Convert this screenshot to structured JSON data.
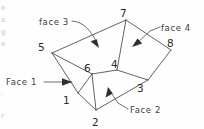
{
  "figure": {
    "background_color": "#fefefe",
    "line_color": "#3a3a3a"
  },
  "vertices": [
    {
      "id": "1",
      "label": "1",
      "point_x": 78,
      "point_y": 93,
      "label_x": 63,
      "label_y": 104
    },
    {
      "id": "2",
      "label": "2",
      "point_x": 96,
      "point_y": 110,
      "label_x": 92,
      "label_y": 126
    },
    {
      "id": "3",
      "label": "3",
      "point_x": 148,
      "point_y": 80,
      "label_x": 137,
      "label_y": 92
    },
    {
      "id": "4",
      "label": "4",
      "point_x": 117,
      "point_y": 70,
      "label_x": 111,
      "label_y": 68
    },
    {
      "id": "5",
      "label": "5",
      "point_x": 52,
      "point_y": 53,
      "label_x": 38,
      "label_y": 51
    },
    {
      "id": "6",
      "label": "6",
      "point_x": 92,
      "point_y": 74,
      "label_x": 84,
      "label_y": 72
    },
    {
      "id": "7",
      "label": "7",
      "point_x": 126,
      "point_y": 20,
      "label_x": 120,
      "label_y": 17
    },
    {
      "id": "8",
      "label": "8",
      "point_x": 171,
      "point_y": 50,
      "label_x": 167,
      "label_y": 47
    }
  ],
  "edges": [
    {
      "name": "edge-5-7",
      "from": "5",
      "to": "7"
    },
    {
      "name": "edge-7-8",
      "from": "7",
      "to": "8"
    },
    {
      "name": "edge-8-3",
      "from": "8",
      "to": "3"
    },
    {
      "name": "edge-3-2",
      "from": "3",
      "to": "2"
    },
    {
      "name": "edge-2-1",
      "from": "2",
      "to": "1"
    },
    {
      "name": "edge-1-5",
      "from": "1",
      "to": "5"
    },
    {
      "name": "edge-5-6",
      "from": "5",
      "to": "6"
    },
    {
      "name": "edge-6-4",
      "from": "6",
      "to": "4"
    },
    {
      "name": "edge-4-7",
      "from": "4",
      "to": "7"
    },
    {
      "name": "edge-4-3",
      "from": "4",
      "to": "3"
    },
    {
      "name": "edge-6-2",
      "from": "6",
      "to": "2"
    },
    {
      "name": "edge-1-6b",
      "from": "1",
      "to": "6"
    }
  ],
  "callouts": [
    {
      "name": "face-1",
      "label": "Face 1",
      "label_x": 6,
      "label_y": 85,
      "leader": "M 44 82 L 72 82",
      "arrow_points": "72,82 62,78.2 62,85.8",
      "target_vertex_hint": "left-side face between 5, 1, 6"
    },
    {
      "name": "face-2",
      "label": "Face 2",
      "label_x": 130,
      "label_y": 113,
      "leader": "M 128 109 L 118 103 L 112 94",
      "arrow_points": "108,87 105.6,97.6 112.8,93.4",
      "target_vertex_hint": "front face between 2, 3, 4, 6"
    },
    {
      "name": "face-3",
      "label": "face 3",
      "label_x": 39,
      "label_y": 25,
      "leader": "M 72 21 C 84 22 90 30 96 41",
      "arrow_points": "99,48 90.5,41.2 96.8,39.2",
      "target_vertex_hint": "top-left face between 5, 7, 4, 6"
    },
    {
      "name": "face-4",
      "label": "face 4",
      "label_x": 161,
      "label_y": 31,
      "leader": "M 160 27 L 150 31 L 137 43",
      "arrow_points": "132,47 142.2,43.6 137.4,38.6",
      "target_vertex_hint": "top-right face between 7, 8, 3, 4"
    }
  ],
  "margin_marks": [
    {
      "name": "margin-mark-1",
      "x": 1,
      "y": 10,
      "glyph": "e"
    },
    {
      "name": "margin-mark-2",
      "x": 1,
      "y": 22,
      "glyph": "a"
    },
    {
      "name": "margin-mark-3",
      "x": 1,
      "y": 34,
      "glyph": "g"
    },
    {
      "name": "margin-mark-4",
      "x": 1,
      "y": 46,
      "glyph": "e"
    },
    {
      "name": "margin-mark-5",
      "x": 1,
      "y": 96,
      "glyph": "-"
    },
    {
      "name": "margin-mark-6",
      "x": 1,
      "y": 118,
      "glyph": "r"
    }
  ]
}
